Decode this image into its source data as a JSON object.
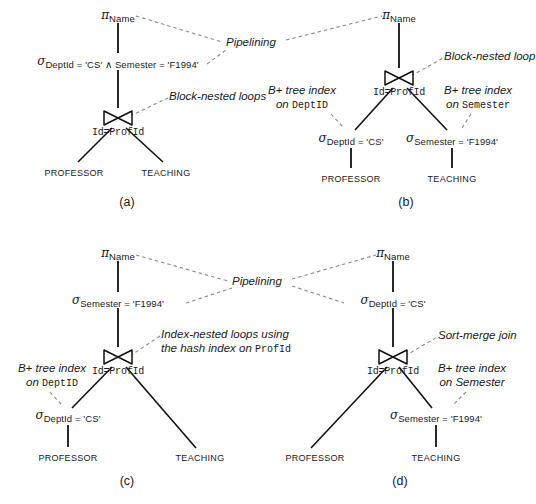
{
  "figure": {
    "caption_a": "(a)",
    "caption_b": "(b)",
    "caption_c": "(c)",
    "caption_d": "(d)"
  },
  "symbols": {
    "pi": "π",
    "sigma": "σ",
    "and": "∧"
  },
  "panel_a": {
    "project": {
      "op": "π",
      "subscript": "Name"
    },
    "select": {
      "op": "σ",
      "subscript": "DeptId = 'CS'  ∧  Semester = 'F1994'"
    },
    "join": {
      "predicate": "Id=ProfId"
    },
    "left_relation": "PROFESSOR",
    "right_relation": "TEACHING",
    "annotation_join": "Block-nested loops",
    "caption": "(a)"
  },
  "panel_b": {
    "project": {
      "op": "π",
      "subscript": "Name"
    },
    "join": {
      "predicate": "Id=ProfId"
    },
    "left_select": {
      "op": "σ",
      "subscript": "DeptId = 'CS'"
    },
    "right_select": {
      "op": "σ",
      "subscript": "Semester = 'F1994'"
    },
    "left_relation": "PROFESSOR",
    "right_relation": "TEACHING",
    "annotation_join": "Block-nested loops",
    "annotation_left_index": {
      "line1": "B+ tree index",
      "line2_prefix": "on ",
      "line2_code": "DeptID"
    },
    "annotation_right_index": {
      "line1": "B+ tree index",
      "line2_prefix": "on ",
      "line2_code": "Semester"
    },
    "caption": "(b)"
  },
  "panel_c": {
    "project": {
      "op": "π",
      "subscript": "Name"
    },
    "select_top": {
      "op": "σ",
      "subscript": "Semester = 'F1994'"
    },
    "join": {
      "predicate": "Id=ProfId"
    },
    "left_select": {
      "op": "σ",
      "subscript": "DeptId = 'CS'"
    },
    "left_relation": "PROFESSOR",
    "right_relation": "TEACHING",
    "annotation_join": {
      "line1": "Index-nested loops using",
      "line2_prefix": "the hash index on ",
      "line2_code": "ProfId"
    },
    "annotation_left_index": {
      "line1": "B+ tree index",
      "line2_prefix": "on ",
      "line2_code": "DeptID"
    },
    "caption": "(c)"
  },
  "panel_d": {
    "project": {
      "op": "π",
      "subscript": "Name"
    },
    "select_top": {
      "op": "σ",
      "subscript": "DeptId = 'CS'"
    },
    "join": {
      "predicate": "Id=ProfId"
    },
    "right_select": {
      "op": "σ",
      "subscript": "Semester = 'F1994'"
    },
    "left_relation": "PROFESSOR",
    "right_relation": "TEACHING",
    "annotation_join": "Sort-merge join",
    "annotation_right_index": {
      "line1": "B+ tree index",
      "line2": "on Semester"
    },
    "caption": "(d)"
  },
  "shared_annotations": {
    "pipelining_top": "Pipelining",
    "pipelining_bottom": "Pipelining"
  },
  "colors": {
    "ink": "#1a1a1a",
    "edge": "#111111",
    "dashed": "#8a8a8a",
    "background": "#ffffff"
  }
}
